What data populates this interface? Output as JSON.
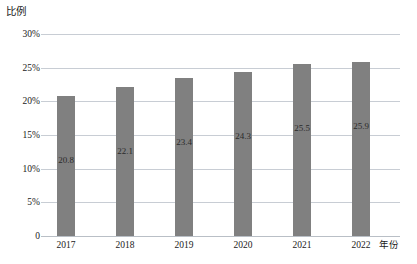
{
  "chart_data": {
    "type": "bar",
    "title": "",
    "xlabel": "年份",
    "ylabel": "比例",
    "categories": [
      "2017",
      "2018",
      "2019",
      "2020",
      "2021",
      "2022"
    ],
    "values": [
      20.8,
      22.1,
      23.4,
      24.3,
      25.5,
      25.9
    ],
    "data_labels": [
      "20.8",
      "22.1",
      "23.4",
      "24.3",
      "25.5",
      "25.9"
    ],
    "ylim": [
      0,
      30
    ],
    "y_ticks": [
      30,
      25,
      20,
      15,
      10,
      5,
      0
    ],
    "y_tick_labels": [
      "30%",
      "25%",
      "20%",
      "15%",
      "10%",
      "5%",
      "0"
    ],
    "grid": true,
    "legend": "none",
    "series": [
      {
        "name": "比例",
        "values": [
          20.8,
          22.1,
          23.4,
          24.3,
          25.5,
          25.9
        ],
        "color": "#808080"
      }
    ],
    "colors": {
      "bar": "#808080",
      "gridline": "#c8cdd4",
      "baseline": "#b9bfc6",
      "text": "#1a1a1a",
      "background": "#ffffff"
    }
  },
  "axes": {
    "y_title": "比例",
    "x_title": "年份"
  },
  "caption": ""
}
